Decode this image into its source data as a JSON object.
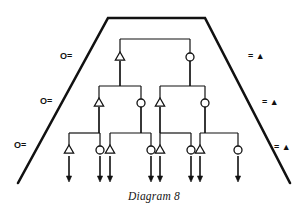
{
  "figure": {
    "caption": "Diagram 8",
    "caption_x": 0,
    "caption_y": 190,
    "stroke_color": "#111111",
    "background_color": "#ffffff"
  },
  "frame": {
    "name": "trapezoid-frame",
    "top_left_x": 108,
    "top_right_x": 205,
    "top_y": 18,
    "bottom_left_x": 18,
    "bottom_right_x": 290,
    "bottom_y": 183,
    "stroke_width": 2.6
  },
  "labels": {
    "left": [
      {
        "text": "O=",
        "x": 60,
        "y": 51
      },
      {
        "text": "O=",
        "x": 40,
        "y": 96
      },
      {
        "text": "O=",
        "x": 14,
        "y": 140
      }
    ],
    "right": [
      {
        "text": "= ▲",
        "x": 248,
        "y": 51
      },
      {
        "text": "= ▲",
        "x": 262,
        "y": 97
      },
      {
        "text": "= ▲",
        "x": 274,
        "y": 142
      }
    ]
  },
  "tree": {
    "levels": [
      {
        "level": 1,
        "y": 57,
        "bar_y": 39,
        "nodes": [
          {
            "shape": "triangle",
            "x": 120
          },
          {
            "shape": "circle",
            "x": 190
          }
        ],
        "bars": [
          {
            "x1": 120,
            "x2": 190
          }
        ]
      },
      {
        "level": 2,
        "y": 103,
        "bar_y": 86,
        "nodes": [
          {
            "shape": "triangle",
            "x": 99
          },
          {
            "shape": "circle",
            "x": 141
          },
          {
            "shape": "triangle",
            "x": 160
          },
          {
            "shape": "circle",
            "x": 205
          }
        ],
        "bars": [
          {
            "x1": 99,
            "x2": 141,
            "stem_x": 120
          },
          {
            "x1": 160,
            "x2": 205,
            "stem_x": 190
          }
        ]
      },
      {
        "level": 3,
        "y": 150,
        "bar_y": 133,
        "nodes": [
          {
            "shape": "triangle",
            "x": 69
          },
          {
            "shape": "circle",
            "x": 100
          },
          {
            "shape": "triangle",
            "x": 110
          },
          {
            "shape": "circle",
            "x": 151
          },
          {
            "shape": "triangle",
            "x": 160
          },
          {
            "shape": "circle",
            "x": 191
          },
          {
            "shape": "triangle",
            "x": 200
          },
          {
            "shape": "circle",
            "x": 238
          }
        ],
        "bars": [
          {
            "x1": 69,
            "x2": 100,
            "stem_x": 99
          },
          {
            "x1": 110,
            "x2": 151,
            "stem_x": 141
          },
          {
            "x1": 160,
            "x2": 191,
            "stem_x": 160
          },
          {
            "x1": 200,
            "x2": 238,
            "stem_x": 205
          }
        ]
      }
    ],
    "arrows": {
      "from_y": 156,
      "to_y": 182,
      "xs": [
        69,
        100,
        110,
        151,
        160,
        191,
        200,
        238
      ]
    },
    "node_radius": 4,
    "triangle_half_width": 4.6,
    "triangle_height": 8
  }
}
